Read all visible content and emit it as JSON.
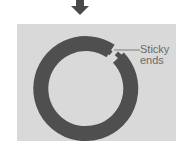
{
  "diagram": {
    "title": "",
    "arrow": {
      "direction": "down",
      "color": "#4a4a4a"
    },
    "panel": {
      "background": "#d9d9d9"
    },
    "ring": {
      "shape": "circular DNA (plasmid) with a break",
      "color": "#4f4f4f"
    },
    "label": {
      "line1": "Sticky",
      "line2": "ends",
      "color": "#6a6a6a",
      "leader_line_color": "#8a8a8a"
    }
  }
}
